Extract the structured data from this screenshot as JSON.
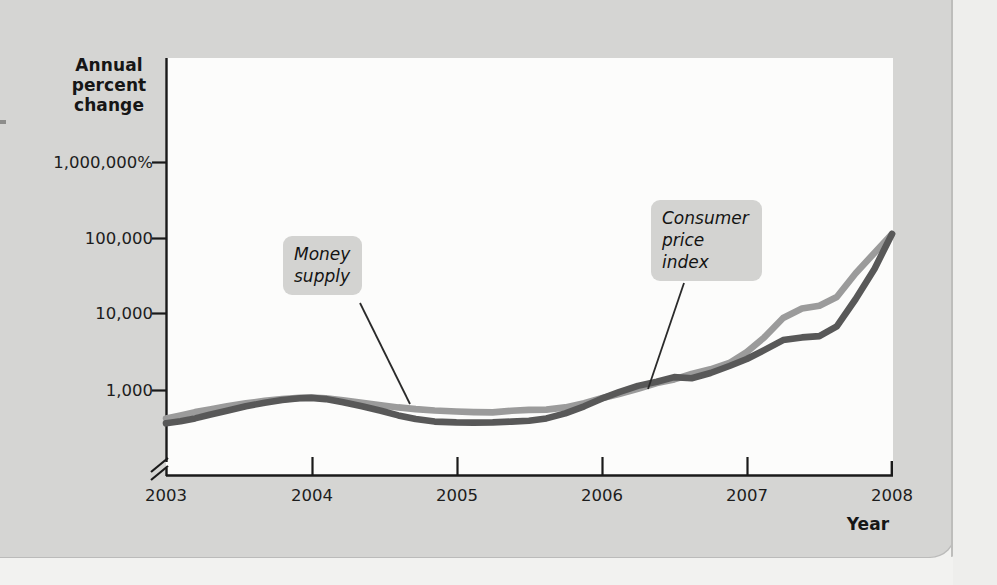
{
  "figure": {
    "background_color": "#d5d5d3",
    "plot_background_color": "#fcfcfb",
    "axis_color": "#1a1a1a"
  },
  "axis_titles": {
    "y": "Annual\npercent\nchange",
    "y_line1": "Annual",
    "y_line2": "percent",
    "y_line3": "change",
    "x": "Year"
  },
  "callouts": {
    "money_supply": {
      "line1": "Money",
      "line2": "supply",
      "text": "Money supply",
      "box_color": "#d3d3d1"
    },
    "consumer_price_index": {
      "line1": "Consumer",
      "line2": "price",
      "line3": "index",
      "text": "Consumer price index",
      "box_color": "#d3d3d1"
    }
  },
  "chart_data": {
    "type": "line",
    "title": "",
    "subtitle": "",
    "xlabel": "Year",
    "ylabel": "Annual percent change",
    "yscale": "log",
    "y_axis_broken": true,
    "grid": false,
    "legend": "callout-labels",
    "x_tick_labels": [
      "2003",
      "2004",
      "2005",
      "2006",
      "2007",
      "2008"
    ],
    "y_tick_labels": [
      "1,000,000%",
      "100,000",
      "10,000",
      "1,000"
    ],
    "y_tick_values": [
      1000000,
      100000,
      10000,
      1000
    ],
    "ylim": [
      300,
      3000000
    ],
    "xlim": [
      "2003",
      "2008"
    ],
    "series": [
      {
        "name": "Money supply",
        "color": "#9b9b9b",
        "x": [
          "2003.00",
          "2003.10",
          "2003.20",
          "2003.30",
          "2003.42",
          "2003.55",
          "2003.68",
          "2003.80",
          "2003.92",
          "2004.00",
          "2004.10",
          "2004.22",
          "2004.35",
          "2004.48",
          "2004.60",
          "2004.72",
          "2004.85",
          "2005.00",
          "2005.12",
          "2005.25",
          "2005.38",
          "2005.50",
          "2005.62",
          "2005.75",
          "2005.88",
          "2006.00",
          "2006.12",
          "2006.25",
          "2006.38",
          "2006.50",
          "2006.62",
          "2006.75",
          "2006.88",
          "2007.00",
          "2007.12",
          "2007.25",
          "2007.38",
          "2007.50",
          "2007.62",
          "2007.75",
          "2007.88",
          "2008.00"
        ],
        "values": [
          430,
          470,
          520,
          560,
          620,
          680,
          730,
          770,
          800,
          810,
          790,
          740,
          690,
          640,
          600,
          570,
          545,
          530,
          520,
          515,
          540,
          555,
          560,
          600,
          680,
          790,
          900,
          1050,
          1250,
          1400,
          1650,
          1900,
          2300,
          3200,
          5000,
          9000,
          12000,
          13000,
          17000,
          35000,
          65000,
          115000
        ]
      },
      {
        "name": "Consumer price index",
        "color": "#585858",
        "x": [
          "2003.00",
          "2003.10",
          "2003.20",
          "2003.30",
          "2003.42",
          "2003.55",
          "2003.68",
          "2003.80",
          "2003.92",
          "2004.00",
          "2004.10",
          "2004.22",
          "2004.35",
          "2004.48",
          "2004.60",
          "2004.72",
          "2004.85",
          "2005.00",
          "2005.12",
          "2005.25",
          "2005.38",
          "2005.50",
          "2005.62",
          "2005.75",
          "2005.88",
          "2006.00",
          "2006.12",
          "2006.25",
          "2006.38",
          "2006.50",
          "2006.62",
          "2006.75",
          "2006.88",
          "2007.00",
          "2007.12",
          "2007.25",
          "2007.38",
          "2007.50",
          "2007.62",
          "2007.75",
          "2007.88",
          "2008.00"
        ],
        "values": [
          370,
          395,
          430,
          480,
          540,
          620,
          690,
          750,
          790,
          800,
          770,
          700,
          620,
          540,
          470,
          420,
          390,
          380,
          378,
          380,
          390,
          400,
          430,
          500,
          620,
          780,
          950,
          1150,
          1300,
          1500,
          1450,
          1700,
          2100,
          2600,
          3400,
          4600,
          5000,
          5200,
          7000,
          16000,
          40000,
          115000
        ]
      }
    ],
    "annotations": [
      {
        "text": "Money supply",
        "leader_from": [
          360,
          303
        ],
        "leader_to": [
          410,
          404
        ]
      },
      {
        "text": "Consumer price index",
        "leader_from": [
          684,
          283
        ],
        "leader_to": [
          648,
          389
        ]
      }
    ]
  }
}
